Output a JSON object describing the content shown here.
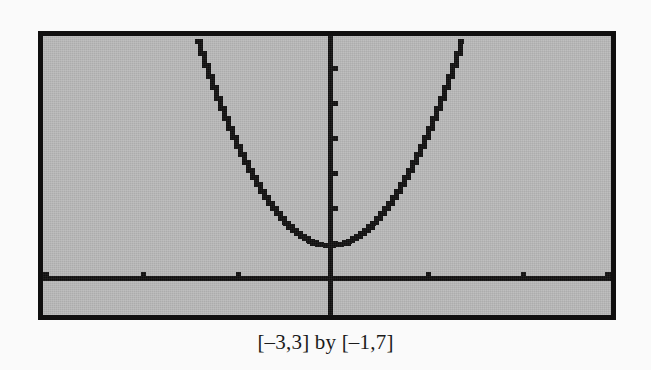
{
  "figure": {
    "caption": "[–3,3] by [–1,7]",
    "screen_background_color": "#b9b9b9",
    "ink_color": "#100f0f",
    "page_background_color": "#fafafa"
  },
  "chart_data": {
    "type": "line",
    "title": "",
    "subtitle": "",
    "caption": "[–3,3] by [–1,7]",
    "xlabel": "",
    "ylabel": "",
    "xlim": [
      -3,
      3
    ],
    "ylim": [
      -1,
      7
    ],
    "grid": false,
    "legend": "none",
    "axes": {
      "x_axis_visible": true,
      "y_axis_visible": true,
      "x_axis_at_y": 0,
      "y_axis_at_x": 0,
      "xtick_spacing": 1,
      "ytick_spacing": 1,
      "xticks": [
        -2,
        -1,
        1,
        2
      ],
      "yticks": [
        1,
        2,
        3,
        4,
        5,
        6
      ],
      "tick_style": "pixel-dot"
    },
    "series": [
      {
        "name": "y = 3x² + 1",
        "style": "stair-stepped pixel curve",
        "color": "#100f0f",
        "x": [
          -1.41,
          -1.3,
          -1.2,
          -1.1,
          -1.0,
          -0.9,
          -0.8,
          -0.7,
          -0.6,
          -0.5,
          -0.4,
          -0.3,
          -0.2,
          -0.1,
          0.0,
          0.1,
          0.2,
          0.3,
          0.4,
          0.5,
          0.6,
          0.7,
          0.8,
          0.9,
          1.0,
          1.1,
          1.2,
          1.3,
          1.41
        ],
        "y": [
          7.0,
          6.07,
          5.32,
          4.63,
          4.0,
          3.43,
          2.92,
          2.47,
          2.08,
          1.75,
          1.48,
          1.27,
          1.12,
          1.03,
          1.0,
          1.03,
          1.12,
          1.27,
          1.48,
          1.75,
          2.08,
          2.47,
          2.92,
          3.43,
          4.0,
          4.63,
          5.32,
          6.07,
          7.0
        ]
      }
    ],
    "vertex": {
      "x": 0,
      "y": 1
    }
  }
}
